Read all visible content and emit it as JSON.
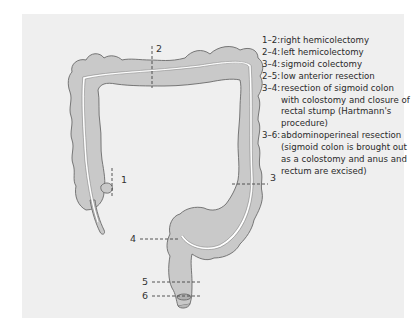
{
  "figure": {
    "panel_bg": "#efefef",
    "organ_fill": "#c9c9c9",
    "organ_stroke": "#6a6a6a"
  },
  "markers": [
    {
      "id": "1",
      "label": "1"
    },
    {
      "id": "2",
      "label": "2"
    },
    {
      "id": "3",
      "label": "3"
    },
    {
      "id": "4",
      "label": "4"
    },
    {
      "id": "5",
      "label": "5"
    },
    {
      "id": "6",
      "label": "6"
    }
  ],
  "legend": [
    {
      "key": "1–2:",
      "text": "right hemicolectomy"
    },
    {
      "key": "2–4:",
      "text": "left hemicolectomy"
    },
    {
      "key": "3–4:",
      "text": "sigmoid colectomy"
    },
    {
      "key": "2–5:",
      "text": "low anterior resection"
    },
    {
      "key": "3–4:",
      "text": "resection of sigmoid colon with colostomy and closure of rectal stump (Hartmann's procedure)"
    },
    {
      "key": "3–6:",
      "text": "abdominoperineal resection (sigmoid colon is brought out as a colostomy and anus and rectum are excised)"
    }
  ]
}
